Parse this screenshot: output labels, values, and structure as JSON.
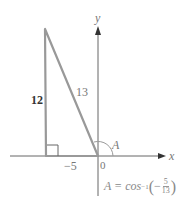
{
  "diagram": {
    "type": "right-triangle-on-coordinate-axes",
    "axes": {
      "x_label": "x",
      "y_label": "y",
      "origin_label": "0"
    },
    "triangle": {
      "vertical_side_label": "12",
      "hypotenuse_label": "13",
      "horizontal_side_label": "−5",
      "angle_label": "A"
    },
    "formula": {
      "lhs": "A = cos",
      "exponent": "−1",
      "sign": "−",
      "numerator": "5",
      "denominator": "13"
    },
    "colors": {
      "triangle": "#999999",
      "axes": "#555555",
      "label": "#777777"
    }
  }
}
